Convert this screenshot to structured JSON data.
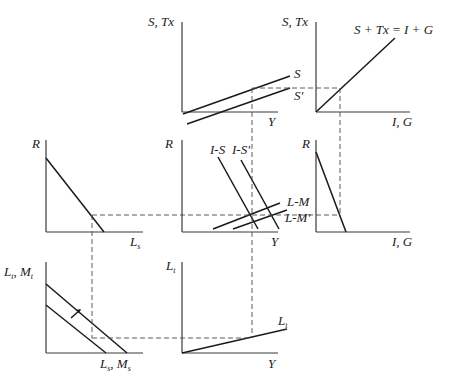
{
  "panels": {
    "saving": {
      "y_label": "S, Tx",
      "x_label": "Y",
      "curve_labels": [
        "S",
        "S'"
      ]
    },
    "equilibrium": {
      "y_label": "S, Tx",
      "x_label": "I, G",
      "curve_label": "S + Tx = I + G"
    },
    "liquidity_speculative": {
      "y_label": "R",
      "x_label_main": "L",
      "x_label_sub": "s"
    },
    "islm": {
      "y_label": "R",
      "x_label": "Y",
      "curve_labels": [
        "I-S",
        "I-S'",
        "L-M",
        "L-M'"
      ]
    },
    "investment": {
      "y_label": "R",
      "x_label": "I, G"
    },
    "money_market": {
      "y_label_1": "L",
      "y_label_1_sub": "t",
      "y_label_sep": ", ",
      "y_label_2": "M",
      "y_label_2_sub": "t",
      "x_label_1": "L",
      "x_label_1_sub": "s",
      "x_label_sep": ", ",
      "x_label_2": "M",
      "x_label_2_sub": "s"
    },
    "transactions": {
      "y_label_main": "L",
      "y_label_sub": "t",
      "x_label": "Y",
      "curve_label_main": "L",
      "curve_label_sub": "t"
    }
  }
}
